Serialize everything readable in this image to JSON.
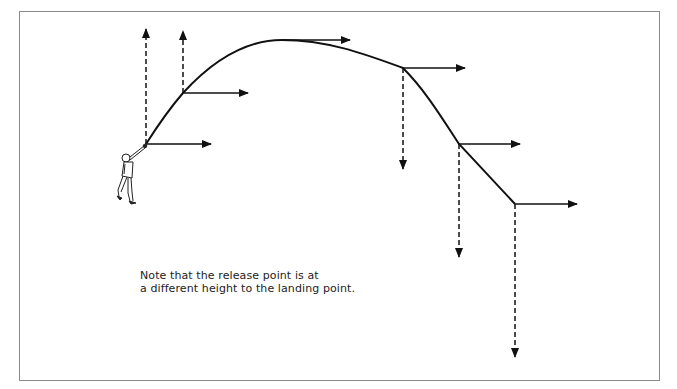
{
  "diagram": {
    "type": "projectile-trajectory",
    "note": {
      "line1": "Note that the release point is at",
      "line2": "a different height to the landing point."
    },
    "figure": "thrower-icon",
    "trajectory_points": [
      {
        "x": 146,
        "y": 144,
        "label": "release",
        "vertical": "up",
        "v_end_y": 29,
        "h_end_x": 211
      },
      {
        "x": 183,
        "y": 93,
        "vertical": "up",
        "v_end_y": 31,
        "h_end_x": 248
      },
      {
        "x": 282,
        "y": 40,
        "label": "apex",
        "vertical": "none",
        "h_end_x": 350
      },
      {
        "x": 403,
        "y": 68,
        "vertical": "down",
        "v_end_y": 169,
        "h_end_x": 465
      },
      {
        "x": 459,
        "y": 144,
        "vertical": "down",
        "v_end_y": 257,
        "h_end_x": 520
      },
      {
        "x": 515,
        "y": 204,
        "label": "landing",
        "vertical": "down",
        "v_end_y": 357,
        "h_end_x": 577
      }
    ],
    "legend": {
      "solid_arrow": "horizontal velocity component (constant)",
      "dashed_arrow": "vertical velocity component"
    },
    "colors": {
      "stroke": "#111111",
      "border": "#8a8a8a",
      "background": "#ffffff"
    }
  }
}
